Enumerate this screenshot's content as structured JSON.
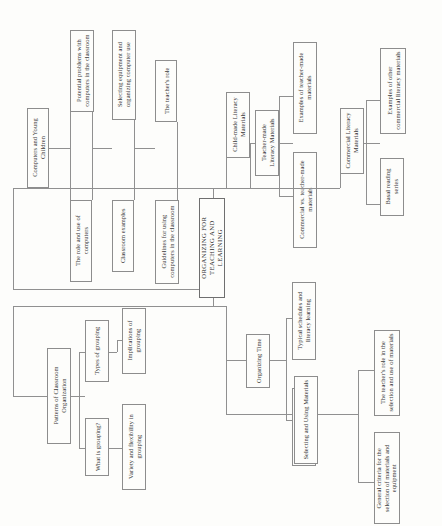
{
  "diagram": {
    "type": "hierarchical-tree",
    "orientation": "rotated-90-ccw",
    "line_color": "#909090",
    "box_fill": "#fdfdfb",
    "text_color": "#3a3a3a",
    "background": "#fdfdfb",
    "root": "ORGANIZING FOR TEACHING AND LEARNING",
    "branches": [
      {
        "id": "computers",
        "label": "Computers and Young Children",
        "children": [
          {
            "label": "The role and use of computers",
            "children": [
              {
                "label": "Potential problems with computers in the classroom"
              }
            ]
          },
          {
            "label": "Classroom examples",
            "children": [
              {
                "label": "Selecting equipment and organizing computer use"
              }
            ]
          },
          {
            "label": "Guidelines for using computers in the classroom",
            "children": [
              {
                "label": "The teacher's role"
              }
            ]
          }
        ]
      },
      {
        "id": "literacy-materials",
        "label": "Child-made Literacy Materials",
        "children": [
          {
            "label": "Teacher-made Literacy Materials",
            "children": [
              {
                "label": "Examples of teacher-made materials"
              },
              {
                "label": "Commercial vs. teacher-made materials"
              }
            ]
          },
          {
            "label": "Commercial Literacy Materials",
            "children": [
              {
                "label": "Examples of other commercial literacy materials"
              },
              {
                "label": "Basal reading series"
              }
            ]
          }
        ]
      },
      {
        "id": "patterns",
        "label": "Patterns of Classroom Organization",
        "children": [
          {
            "label": "Types of grouping",
            "children": [
              {
                "label": "Implications of grouping"
              }
            ]
          },
          {
            "label": "What is grouping?",
            "children": [
              {
                "label": "Variety and flexibility in grouping"
              }
            ]
          }
        ]
      },
      {
        "id": "time-materials",
        "label": "Organizing Time",
        "children": [
          {
            "label": "Typical schedules and literacy learning"
          },
          {
            "label": "Characteristics of a good schedule"
          }
        ],
        "sibling": {
          "label": "Selecting and Using Materials",
          "children": [
            {
              "label": "The teacher's role in the selection and use of materials"
            },
            {
              "label": "General criteria for the selection of materials and equipment"
            }
          ]
        }
      }
    ],
    "nodes": {
      "computers_and_young_children": "Computers and Young Children",
      "the_role_and_use_of_computers": "The role and use of computers",
      "potential_problems": "Potential problems with computers in the classroom",
      "classroom_examples": "Classroom examples",
      "selecting_equipment": "Selecting equipment and organizing computer use",
      "guidelines_for_using_computers": "Guidelines for using computers in the classroom",
      "the_teachers_role": "The teacher's role",
      "child_made_literacy_materials": "Child-made Literacy Materials",
      "teacher_made_literacy_materials": "Teacher-made Literacy Materials",
      "examples_of_teacher_made_materials": "Examples of teacher-made materials",
      "commercial_vs_teacher_made": "Commercial vs. teacher-made materials",
      "commercial_literacy_materials": "Commercial Literacy Materials",
      "examples_of_other_commercial": "Examples of other commercial literacy materials",
      "basal_reading_series": "Basal reading series",
      "organizing_for_teaching_and_learning": "ORGANIZING FOR TEACHING AND LEARNING",
      "patterns_of_classroom_organization": "Patterns of Classroom Organization",
      "types_of_grouping": "Types of grouping",
      "implications_of_grouping": "Implications of grouping",
      "what_is_grouping": "What is grouping?",
      "variety_and_flexibility": "Variety and flexibility in grouping",
      "organizing_time": "Organizing Time",
      "typical_schedules": "Typical schedules and literacy learning",
      "characteristics_of_a_good_schedule": "Characteristics of a good schedule",
      "selecting_and_using_materials": "Selecting and Using Materials",
      "teachers_role_in_selection": "The teacher's role in the selection and use of materials",
      "general_criteria": "General criteria for the selection of materials and equipment"
    }
  }
}
